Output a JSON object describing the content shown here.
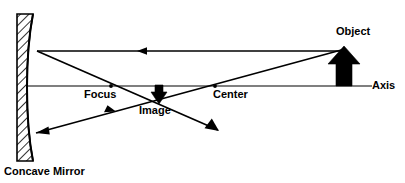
{
  "diagram": {
    "labels": {
      "object": "Object",
      "axis": "Axis",
      "focus": "Focus",
      "center": "Center",
      "image": "Image",
      "mirror": "Concave Mirror"
    },
    "colors": {
      "ink": "#000000",
      "background": "#ffffff",
      "hatch": "#000000"
    },
    "elements": {
      "mirror_name": "concave-mirror",
      "object_arrow_name": "object-arrow",
      "image_arrow_name": "image-arrow",
      "axis_name": "principal-axis",
      "focus_point_name": "focal-point",
      "center_point_name": "center-of-curvature-point"
    },
    "rays": [
      {
        "name": "parallel-incident-ray",
        "description": "From object tip travelling left parallel to the axis toward the mirror",
        "direction": "leftward"
      },
      {
        "name": "reflected-through-focus-ray",
        "description": "Reflected from mirror down through the focal point to lower right",
        "direction": "down-right"
      },
      {
        "name": "incident-through-center-ray",
        "description": "From object tip through the center of curvature toward the mirror",
        "direction": "down-left"
      },
      {
        "name": "reflected-back-ray",
        "description": "Reflected ray returning to the mirror through the image point",
        "direction": "left"
      }
    ]
  }
}
